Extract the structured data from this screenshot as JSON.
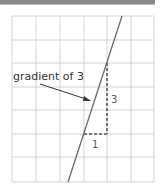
{
  "diagram": {
    "annotation": "gradient of 3",
    "rise_label": "3",
    "run_label": "1",
    "colors": {
      "grid": "#d4d4d4",
      "line": "#6a6a6a",
      "dash": "#555555",
      "text": "#333333",
      "top_bar": "#8a8a8a"
    },
    "grid": {
      "columns": 6,
      "rows": 7
    },
    "line": {
      "gradient": 3
    }
  }
}
